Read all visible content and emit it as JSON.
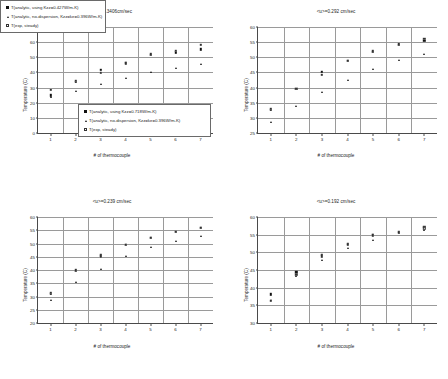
{
  "figure": {
    "background": "#ffffff",
    "marker_color": "#111111",
    "grid_color": "#9a9a9a",
    "axis_color": "#4a4a4a"
  },
  "common": {
    "xlabel": "# of thermocouple",
    "ylabel": "Temperature (C)",
    "xticks": [
      "1",
      "2",
      "3",
      "4",
      "5",
      "6",
      "7"
    ],
    "legend_series_1": "T(analytic, no-dispersion, Kzz=ke=0.396W/m-K)",
    "legend_series_2": "T(exp, steady)"
  },
  "chart_data": [
    {
      "id": "panel-a",
      "type": "scatter",
      "title": "<u>=0.3406cm/sec",
      "xlabel": "# of thermocouple",
      "ylabel": "Temperature (C)",
      "x": [
        1,
        2,
        3,
        4,
        5,
        6,
        7
      ],
      "xlim": [
        0.5,
        7.5
      ],
      "ylim": [
        0,
        70
      ],
      "yticks": [
        0,
        10,
        20,
        30,
        40,
        50,
        60,
        70
      ],
      "grid": true,
      "legend_position": "lower-center",
      "series": [
        {
          "name": "T(analytic, using Kzz=0.718W/m-K)",
          "marker": "filled-square",
          "values": [
            24.8,
            34.0,
            41.8,
            46.2,
            51.5,
            53.4,
            55.2
          ]
        },
        {
          "name": "T(analytic, no-dispersion, Kzz=ke=0.396W/m-K)",
          "marker": "filled-triangle",
          "values": [
            24.0,
            27.5,
            32.2,
            36.1,
            40.3,
            43.1,
            45.8
          ]
        },
        {
          "name": "T(exp, steady)",
          "marker": "open-square",
          "values": [
            28.5,
            34.6,
            39.9,
            45.9,
            51.9,
            54.3,
            58.2
          ]
        }
      ]
    },
    {
      "id": "panel-b",
      "type": "scatter",
      "title": "<u>=0.292 cm/sec",
      "xlabel": "# of thermocouple",
      "ylabel": "Temperature (C)",
      "x": [
        1,
        2,
        3,
        4,
        5,
        6,
        7
      ],
      "xlim": [
        0.5,
        7.5
      ],
      "ylim": [
        25,
        60
      ],
      "yticks": [
        25,
        30,
        35,
        40,
        45,
        50,
        55,
        60
      ],
      "grid": true,
      "legend_position": "lower-right",
      "series": [
        {
          "name": "T(analytic, using Kzz=0.558W/m-K)",
          "marker": "filled-square",
          "values": [
            32.6,
            39.6,
            45.3,
            48.8,
            51.9,
            54.2,
            55.4
          ]
        },
        {
          "name": "T(analytic, no-dispersion, Kzz=ke=0.396W/m-K)",
          "marker": "filled-triangle",
          "values": [
            28.6,
            33.9,
            38.7,
            42.6,
            46.1,
            49.1,
            51.2
          ]
        },
        {
          "name": "T(exp, steady)",
          "marker": "open-square",
          "values": [
            32.9,
            39.5,
            44.2,
            48.9,
            52.0,
            54.3,
            56.2
          ]
        }
      ]
    },
    {
      "id": "panel-c",
      "type": "scatter",
      "title": "<u>=0.239 cm/sec",
      "xlabel": "# of thermocouple",
      "ylabel": "Temperature (C)",
      "x": [
        1,
        2,
        3,
        4,
        5,
        6,
        7
      ],
      "xlim": [
        0.5,
        7.5
      ],
      "ylim": [
        20,
        60
      ],
      "yticks": [
        20,
        25,
        30,
        35,
        40,
        45,
        50,
        55,
        60
      ],
      "grid": true,
      "legend_position": "lower-center",
      "series": [
        {
          "name": "T(analytic, using Kzz=0.486W/m-K)",
          "marker": "filled-square",
          "values": [
            31.1,
            39.7,
            45.5,
            49.5,
            52.2,
            54.5,
            56.0
          ]
        },
        {
          "name": "T(analytic, no-dispersion, Kzz=ke=0.396W/m-K)",
          "marker": "filled-triangle",
          "values": [
            28.5,
            35.3,
            40.5,
            45.2,
            48.5,
            50.8,
            52.9
          ]
        },
        {
          "name": "T(exp, steady)",
          "marker": "open-square",
          "values": [
            31.4,
            39.9,
            45.2,
            49.4,
            52.1,
            54.3,
            55.9
          ]
        }
      ]
    },
    {
      "id": "panel-d",
      "type": "scatter",
      "title": "<u>=0.192 cm/sec",
      "xlabel": "# of thermocouple",
      "ylabel": "Temperature (C)",
      "x": [
        1,
        2,
        3,
        4,
        5,
        6,
        7
      ],
      "xlim": [
        0.5,
        7.5
      ],
      "ylim": [
        30,
        60
      ],
      "yticks": [
        30,
        35,
        40,
        45,
        50,
        55,
        60
      ],
      "grid": true,
      "legend_position": "lower-center",
      "series": [
        {
          "name": "T(analytic, using Kzz=0.427W/m-K)",
          "marker": "filled-square",
          "values": [
            38.1,
            44.4,
            49.3,
            52.4,
            54.9,
            55.8,
            57.3
          ]
        },
        {
          "name": "T(analytic, no-dispersion, Kzz=ke=0.396W/m-K)",
          "marker": "filled-triangle",
          "values": [
            36.4,
            43.2,
            47.9,
            51.1,
            53.6,
            55.4,
            56.2
          ]
        },
        {
          "name": "T(exp, steady)",
          "marker": "open-square",
          "values": [
            36.3,
            43.6,
            48.9,
            52.2,
            54.8,
            55.6,
            56.8
          ]
        }
      ]
    }
  ]
}
